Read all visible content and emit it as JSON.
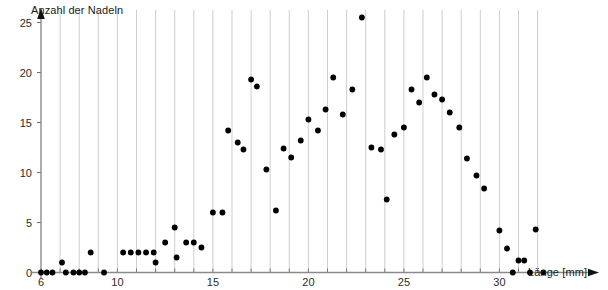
{
  "chart_data": {
    "type": "scatter",
    "title": "",
    "xlabel": "Länge [mm]",
    "ylabel": "Anzahl der Nadeln",
    "xlim": [
      6,
      32.5
    ],
    "ylim": [
      0,
      26.5
    ],
    "xticks": [
      6,
      10,
      15,
      20,
      25,
      30
    ],
    "yticks": [
      0,
      5,
      10,
      15,
      20,
      25
    ],
    "grid": "vertical",
    "legend": "none",
    "marker": "filled-circle",
    "marker_color": "#000000",
    "points": [
      {
        "x": 6.0,
        "y": 0
      },
      {
        "x": 6.3,
        "y": 0
      },
      {
        "x": 6.6,
        "y": 0
      },
      {
        "x": 7.1,
        "y": 1
      },
      {
        "x": 7.3,
        "y": 0
      },
      {
        "x": 7.7,
        "y": 0
      },
      {
        "x": 8.0,
        "y": 0
      },
      {
        "x": 8.3,
        "y": 0
      },
      {
        "x": 8.6,
        "y": 2
      },
      {
        "x": 9.3,
        "y": 0
      },
      {
        "x": 10.3,
        "y": 2
      },
      {
        "x": 10.7,
        "y": 2
      },
      {
        "x": 11.1,
        "y": 2
      },
      {
        "x": 11.5,
        "y": 2
      },
      {
        "x": 11.9,
        "y": 2
      },
      {
        "x": 12.0,
        "y": 1
      },
      {
        "x": 12.5,
        "y": 3
      },
      {
        "x": 13.0,
        "y": 4.5
      },
      {
        "x": 13.1,
        "y": 1.5
      },
      {
        "x": 13.6,
        "y": 3
      },
      {
        "x": 14.0,
        "y": 3
      },
      {
        "x": 14.4,
        "y": 2.5
      },
      {
        "x": 15.0,
        "y": 6
      },
      {
        "x": 15.5,
        "y": 6
      },
      {
        "x": 15.8,
        "y": 14.2
      },
      {
        "x": 16.3,
        "y": 13.0
      },
      {
        "x": 16.6,
        "y": 12.3
      },
      {
        "x": 17.0,
        "y": 19.3
      },
      {
        "x": 17.3,
        "y": 18.6
      },
      {
        "x": 17.8,
        "y": 10.3
      },
      {
        "x": 18.3,
        "y": 6.2
      },
      {
        "x": 18.7,
        "y": 12.4
      },
      {
        "x": 19.1,
        "y": 11.5
      },
      {
        "x": 19.6,
        "y": 13.2
      },
      {
        "x": 20.0,
        "y": 15.3
      },
      {
        "x": 20.5,
        "y": 14.2
      },
      {
        "x": 20.9,
        "y": 16.3
      },
      {
        "x": 21.3,
        "y": 19.5
      },
      {
        "x": 21.8,
        "y": 15.8
      },
      {
        "x": 22.3,
        "y": 18.3
      },
      {
        "x": 22.8,
        "y": 25.5
      },
      {
        "x": 23.3,
        "y": 12.5
      },
      {
        "x": 23.8,
        "y": 12.3
      },
      {
        "x": 24.1,
        "y": 7.3
      },
      {
        "x": 24.5,
        "y": 13.8
      },
      {
        "x": 25.0,
        "y": 14.5
      },
      {
        "x": 25.4,
        "y": 18.3
      },
      {
        "x": 25.8,
        "y": 17.0
      },
      {
        "x": 26.2,
        "y": 19.5
      },
      {
        "x": 26.6,
        "y": 17.8
      },
      {
        "x": 27.0,
        "y": 17.3
      },
      {
        "x": 27.4,
        "y": 16.0
      },
      {
        "x": 27.9,
        "y": 14.5
      },
      {
        "x": 28.3,
        "y": 11.4
      },
      {
        "x": 28.8,
        "y": 9.7
      },
      {
        "x": 29.2,
        "y": 8.4
      },
      {
        "x": 30.0,
        "y": 4.2
      },
      {
        "x": 30.4,
        "y": 2.4
      },
      {
        "x": 30.7,
        "y": 0
      },
      {
        "x": 31.0,
        "y": 1.2
      },
      {
        "x": 31.3,
        "y": 1.2
      },
      {
        "x": 31.6,
        "y": 0
      },
      {
        "x": 31.9,
        "y": 4.3
      },
      {
        "x": 32.3,
        "y": 0
      }
    ]
  }
}
